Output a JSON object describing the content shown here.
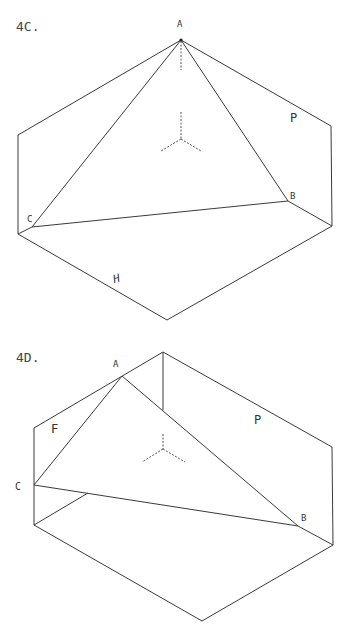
{
  "figures": [
    {
      "id": "4C",
      "title": "4C.",
      "labels": {
        "A": "A",
        "B": "B",
        "C": "C",
        "P": "P",
        "H": "H"
      }
    },
    {
      "id": "4D",
      "title": "4D.",
      "labels": {
        "A": "A",
        "B": "B",
        "C": "C",
        "P": "P",
        "F": "F"
      }
    }
  ],
  "colors": {
    "line": "#3a3a3a",
    "text": "#333333",
    "background": "#ffffff"
  }
}
